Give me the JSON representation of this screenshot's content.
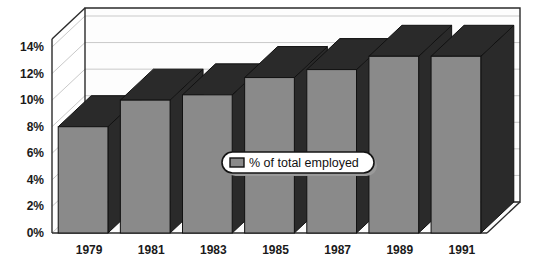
{
  "chart_data": {
    "type": "bar",
    "title": "",
    "subtitle": "",
    "xlabel": "",
    "ylabel": "",
    "categories": [
      "1979",
      "1981",
      "1983",
      "1985",
      "1987",
      "1989",
      "1991"
    ],
    "series": [
      {
        "name": "% of total employed",
        "values": [
          8.0,
          10.0,
          10.4,
          11.7,
          12.3,
          13.3,
          13.3
        ]
      }
    ],
    "ytick_labels": [
      "0%",
      "2%",
      "4%",
      "6%",
      "8%",
      "10%",
      "12%",
      "14%"
    ],
    "ytick_values": [
      0,
      2,
      4,
      6,
      8,
      10,
      12,
      14
    ],
    "ylim": [
      0,
      14
    ],
    "grid": true,
    "legend": {
      "position": "center",
      "entries": [
        {
          "label": "% of total employed",
          "swatch_color": "#8a8a8a"
        }
      ]
    },
    "style": {
      "three_d": true,
      "bar_face_color": "#8a8a8a",
      "bar_top_color": "#2a2a2a",
      "bar_side_color": "#2a2a2a",
      "bar_outline_color": "#111111",
      "plot_background": "#fdfdfd",
      "gridline_color": "#c9c9c9",
      "frame_color": "#2b2b2b",
      "text_color": "#1a1a1a"
    }
  }
}
